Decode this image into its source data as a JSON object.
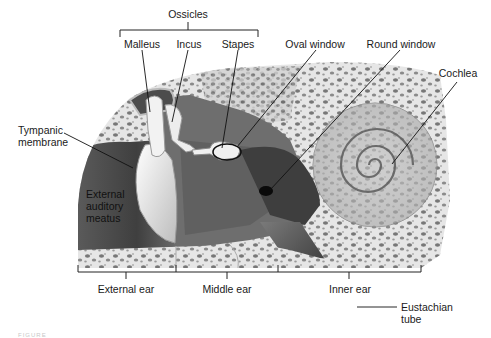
{
  "figure": {
    "group_labels": {
      "ossicles": "Ossicles"
    },
    "labels": {
      "malleus": "Malleus",
      "incus": "Incus",
      "stapes": "Stapes",
      "oval_window": "Oval window",
      "round_window": "Round window",
      "cochlea": "Cochlea",
      "tympanic_membrane_line1": "Tympanic",
      "tympanic_membrane_line2": "membrane",
      "eam_line1": "External",
      "eam_line2": "auditory",
      "eam_line3": "meatus",
      "eustachian_line1": "Eustachian",
      "eustachian_line2": "tube"
    },
    "regions": [
      {
        "label": "External ear"
      },
      {
        "label": "Middle ear"
      },
      {
        "label": "Inner ear"
      }
    ],
    "caption": "FIGURE"
  },
  "colors": {
    "bone_light": "#e9e9e9",
    "bone_pore": "#6e6e6e",
    "canal_dark": "#4a4a4a",
    "cavity_mid": "#8a8a8a",
    "structure_white": "#f4f4f4",
    "leader_line": "#111111",
    "text": "#1a1a1a"
  }
}
